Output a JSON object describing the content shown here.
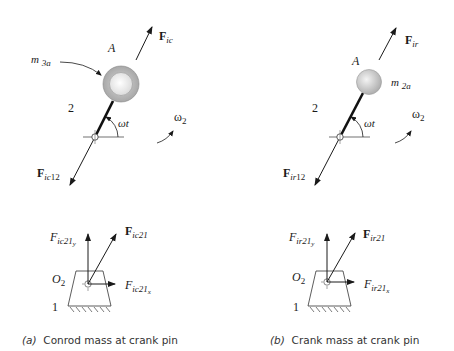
{
  "panel_a": {
    "caption_letter": "(a)",
    "caption_text": "Conrod mass at crank pin",
    "point_label": "A",
    "link_label": "2",
    "mass_label": "m",
    "mass_sub": "3a",
    "force_top": "F",
    "force_top_sub": "ic",
    "force_bottom": "F",
    "force_bottom_sub": "ic",
    "force_bottom_sub2": "12",
    "angle_label": "ωt",
    "omega_label": "ω",
    "omega_sub": "2",
    "ground_pivot_label": "O",
    "ground_pivot_sub": "2",
    "ground_label": "1",
    "reaction": "F",
    "reaction_sub": "ic21",
    "reaction_y": "F",
    "reaction_y_sub": "ic21",
    "reaction_y_sub2": "y",
    "reaction_x": "F",
    "reaction_x_sub": "ic21",
    "reaction_x_sub2": "x"
  },
  "panel_b": {
    "caption_letter": "(b)",
    "caption_text": "Crank mass at crank pin",
    "point_label": "A",
    "link_label": "2",
    "mass_label": "m",
    "mass_sub": "2a",
    "force_top": "F",
    "force_top_sub": "ir",
    "force_bottom": "F",
    "force_bottom_sub": "ir",
    "force_bottom_sub2": "12",
    "angle_label": "ωt",
    "omega_label": "ω",
    "omega_sub": "2",
    "ground_pivot_label": "O",
    "ground_pivot_sub": "2",
    "ground_label": "1",
    "reaction": "F",
    "reaction_sub": "ir21",
    "reaction_y": "F",
    "reaction_y_sub": "ir21",
    "reaction_y_sub2": "y",
    "reaction_x": "F",
    "reaction_x_sub": "ir21",
    "reaction_x_sub2": "x"
  }
}
